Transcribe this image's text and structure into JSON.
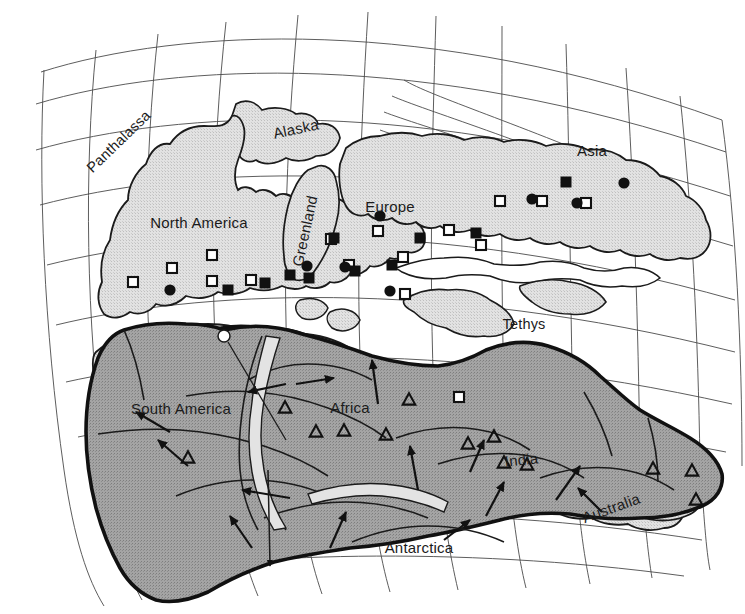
{
  "figure": {
    "kind": "paleogeographic-reconstruction-map",
    "projection_grid": "curved latitude-longitude graticule",
    "background_color": "#ffffff",
    "land_fill_color": "#dcdcdc",
    "gondwana_fill_color": "#9d9d9d",
    "coastline_color": "#1b1b1b",
    "graticule_color": "#4a4a4a",
    "symbol_color": "#111111"
  },
  "continent_labels": [
    {
      "name": "north-america",
      "text": "North America",
      "x": 199,
      "y": 228,
      "rotate": 0,
      "size": 15
    },
    {
      "name": "alaska",
      "text": "Alaska",
      "x": 297,
      "y": 134,
      "rotate": -12,
      "size": 14.5
    },
    {
      "name": "greenland",
      "text": "Greenland",
      "x": 310,
      "y": 232,
      "rotate": -78,
      "size": 14.5
    },
    {
      "name": "europe",
      "text": "Europe",
      "x": 390,
      "y": 212,
      "rotate": 0,
      "size": 15
    },
    {
      "name": "asia",
      "text": "Asia",
      "x": 592,
      "y": 156,
      "rotate": 0,
      "size": 15
    },
    {
      "name": "south-america",
      "text": "South America",
      "x": 181,
      "y": 414,
      "rotate": 0,
      "size": 15
    },
    {
      "name": "africa",
      "text": "Africa",
      "x": 350,
      "y": 413,
      "rotate": 0,
      "size": 15
    },
    {
      "name": "india",
      "text": "India",
      "x": 522,
      "y": 465,
      "rotate": -6,
      "size": 15
    },
    {
      "name": "australia",
      "text": "Australia",
      "x": 613,
      "y": 513,
      "rotate": -20,
      "size": 15
    },
    {
      "name": "antarctica",
      "text": "Antarctica",
      "x": 419,
      "y": 553,
      "rotate": 0,
      "size": 15
    }
  ],
  "ocean_labels": [
    {
      "name": "panthalassa",
      "text": "Panthalassa",
      "x": 122,
      "y": 145,
      "rotate": -44,
      "size": 14.5
    },
    {
      "name": "tethys",
      "text": "Tethys",
      "x": 524,
      "y": 329,
      "rotate": 0,
      "size": 15
    }
  ],
  "symbols": {
    "open_square": {
      "icon": "open-square-icon",
      "count": 16,
      "size": 11
    },
    "filled_square": {
      "icon": "filled-square-icon",
      "count": 10,
      "size": 11
    },
    "filled_circle": {
      "icon": "filled-circle-icon",
      "count": 8,
      "size": 11
    },
    "open_triangle": {
      "icon": "open-triangle-icon",
      "count": 13,
      "size": 13
    }
  },
  "symbol_points": {
    "open_square": [
      [
        133,
        282
      ],
      [
        172,
        268
      ],
      [
        212,
        255
      ],
      [
        212,
        281
      ],
      [
        251,
        280
      ],
      [
        331,
        239
      ],
      [
        378,
        231
      ],
      [
        349,
        265
      ],
      [
        403,
        257
      ],
      [
        405,
        294
      ],
      [
        449,
        230
      ],
      [
        459,
        397
      ],
      [
        500,
        201
      ],
      [
        542,
        201
      ],
      [
        586,
        203
      ],
      [
        481,
        245
      ]
    ],
    "filled_square": [
      [
        228,
        290
      ],
      [
        265,
        283
      ],
      [
        290,
        275
      ],
      [
        309,
        278
      ],
      [
        355,
        271
      ],
      [
        334,
        238
      ],
      [
        392,
        265
      ],
      [
        420,
        238
      ],
      [
        476,
        233
      ],
      [
        566,
        182
      ]
    ],
    "filled_circle": [
      [
        170,
        290
      ],
      [
        307,
        266
      ],
      [
        345,
        267
      ],
      [
        380,
        216
      ],
      [
        390,
        291
      ],
      [
        532,
        199
      ],
      [
        577,
        203
      ],
      [
        624,
        183
      ]
    ],
    "open_triangle": [
      [
        188,
        458
      ],
      [
        285,
        408
      ],
      [
        316,
        432
      ],
      [
        344,
        431
      ],
      [
        386,
        435
      ],
      [
        409,
        400
      ],
      [
        468,
        444
      ],
      [
        494,
        437
      ],
      [
        504,
        463
      ],
      [
        527,
        465
      ],
      [
        653,
        469
      ],
      [
        692,
        471
      ],
      [
        696,
        500
      ]
    ]
  },
  "movement_arrows": {
    "name": "gondwana-motion-arrows",
    "count": 13,
    "description": "motion arrows inside Gondwana"
  },
  "leader": {
    "name": "pole-leader-line",
    "circle_marker": {
      "x": 224,
      "y": 336,
      "r": 6
    },
    "description": "small open circle with leader line running south into Antarctica, terminating in a downward arrow"
  }
}
